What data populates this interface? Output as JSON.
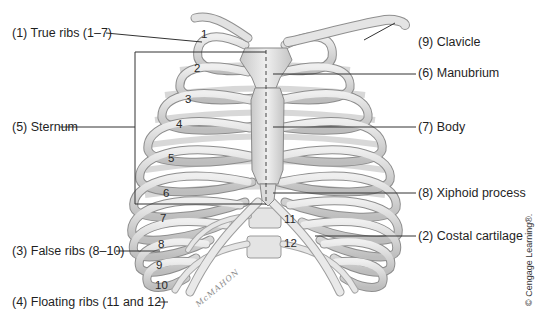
{
  "diagram": {
    "labels": {
      "true_ribs": "(1) True ribs (1–7)",
      "costal_cartilage": "(2) Costal cartilage",
      "false_ribs": "(3) False ribs (8–10)",
      "floating_ribs": "(4) Floating ribs (11 and 12)",
      "sternum": "(5) Sternum",
      "manubrium": "(6) Manubrium",
      "body": "(7) Body",
      "xiphoid": "(8) Xiphoid process",
      "clavicle": "(9) Clavicle"
    },
    "rib_numbers": [
      "1",
      "2",
      "3",
      "4",
      "5",
      "6",
      "7",
      "8",
      "9",
      "10",
      "11",
      "12"
    ],
    "credit": "© Cengage Learning®.",
    "artist_signature": "McMAHON",
    "colors": {
      "background": "#ffffff",
      "bone": "#dcdcdc",
      "bone_shadow": "#9a9a9a",
      "cartilage": "#eeeeee",
      "leader_line": "#333333",
      "text": "#1f1f1f"
    }
  }
}
